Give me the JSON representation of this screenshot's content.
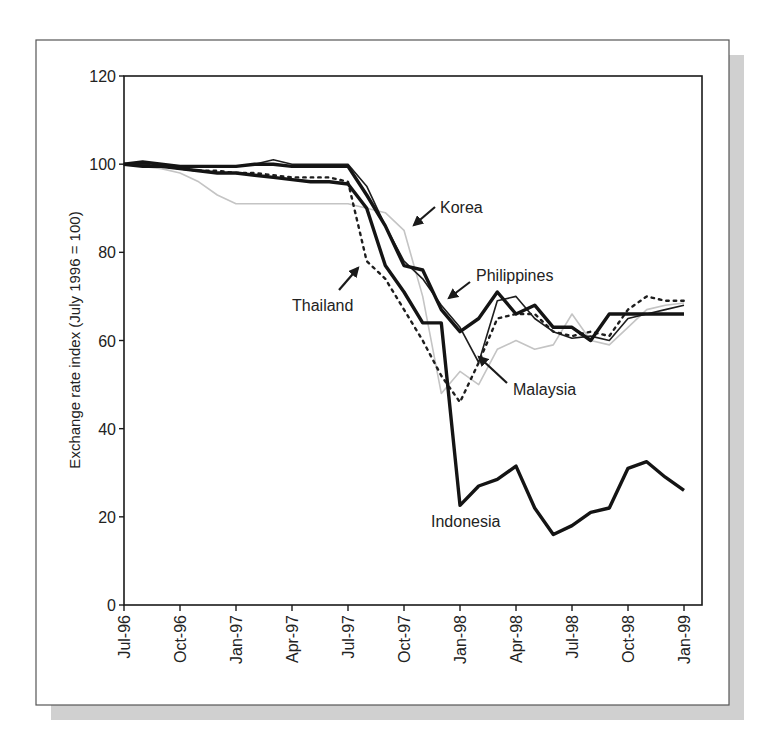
{
  "chart_data": {
    "type": "line",
    "title": "",
    "xlabel": "",
    "ylabel": "Exchange rate index (July 1996 = 100)",
    "ylim": [
      0,
      120
    ],
    "yticks": [
      0,
      20,
      40,
      60,
      80,
      100,
      120
    ],
    "grid": false,
    "legend": "inline annotations with arrows",
    "x": [
      "Jul-96",
      "Aug-96",
      "Sep-96",
      "Oct-96",
      "Nov-96",
      "Dec-96",
      "Jan-97",
      "Feb-97",
      "Mar-97",
      "Apr-97",
      "May-97",
      "Jun-97",
      "Jul-97",
      "Aug-97",
      "Sep-97",
      "Oct-97",
      "Nov-97",
      "Dec-97",
      "Jan-98",
      "Feb-98",
      "Mar-98",
      "Apr-98",
      "May-98",
      "Jun-98",
      "Jul-98",
      "Aug-98",
      "Sep-98",
      "Oct-98",
      "Nov-98",
      "Dec-98",
      "Jan-99"
    ],
    "xtick_labels": [
      "Jul-96",
      "Oct-96",
      "Jan-97",
      "Apr-97",
      "Jul-97",
      "Oct-97",
      "Jan-98",
      "Apr-98",
      "Jul-98",
      "Oct-98",
      "Jan-99"
    ],
    "series": [
      {
        "name": "Philippines",
        "style": "thick-solid",
        "values": [
          100,
          100.5,
          100,
          99.5,
          99.5,
          99.5,
          99.5,
          100,
          100,
          99.5,
          99.5,
          99.5,
          99.5,
          93,
          86,
          77,
          76,
          67,
          62,
          65,
          71,
          66,
          68,
          63,
          63,
          60,
          66,
          66,
          66,
          66,
          66
        ]
      },
      {
        "name": "Indonesia",
        "style": "thick-solid",
        "values": [
          100,
          99.5,
          99.5,
          99,
          98.5,
          98,
          98,
          97.5,
          97,
          96.5,
          96,
          96,
          95.5,
          90,
          77,
          71,
          64,
          64,
          22.6,
          27,
          28.5,
          31.5,
          22,
          16,
          18,
          21,
          22,
          31,
          32.5,
          29,
          26
        ]
      },
      {
        "name": "Malaysia",
        "style": "thin-solid",
        "values": [
          100,
          100,
          99.5,
          99.5,
          99.5,
          99.5,
          99.5,
          100,
          101,
          100,
          100,
          100,
          100,
          95,
          86,
          78,
          74,
          68,
          63,
          55,
          69,
          70,
          65,
          62,
          60.5,
          61,
          60,
          65,
          66,
          67,
          68
        ]
      },
      {
        "name": "Thailand",
        "style": "dotted",
        "values": [
          100,
          100,
          99.5,
          99,
          98.5,
          98.5,
          98,
          98,
          97.5,
          97,
          97,
          97,
          96,
          78,
          74,
          67,
          60,
          52,
          46,
          55,
          65,
          66,
          66,
          62,
          61,
          62,
          61,
          67,
          70,
          69,
          69
        ]
      },
      {
        "name": "Korea",
        "style": "light-gray-solid",
        "values": [
          100,
          99.5,
          99,
          98,
          96,
          93,
          91,
          91,
          91,
          91,
          91,
          91,
          91,
          90,
          89,
          85,
          70,
          48,
          53,
          50,
          58,
          60,
          58,
          59,
          66,
          60,
          59,
          63,
          67,
          68,
          68.5
        ]
      }
    ],
    "annotations": [
      {
        "text": "Korea",
        "target_series": "Korea"
      },
      {
        "text": "Philippines",
        "target_series": "Philippines"
      },
      {
        "text": "Thailand",
        "target_series": "Thailand"
      },
      {
        "text": "Malaysia",
        "target_series": "Malaysia"
      },
      {
        "text": "Indonesia",
        "target_series": "Indonesia"
      }
    ]
  },
  "colors": {
    "axis": "#1a1a1a",
    "thick_line": "#141414",
    "thin_line": "#1e1e1e",
    "dotted_line": "#1e1e1e",
    "korea_line": "#c4c4c4",
    "frame": "#555555",
    "shadow": "#d0d0d0"
  }
}
